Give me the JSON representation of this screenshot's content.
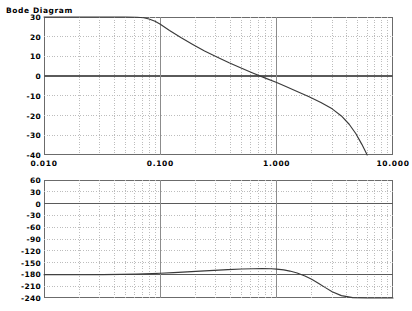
{
  "chart_data": {
    "type": "line",
    "title": "Bode Diagram",
    "subtitle": "",
    "xlabel": "",
    "xscale": "log",
    "xlim": [
      0.01,
      10.0
    ],
    "xticks": [
      0.01,
      0.1,
      1.0,
      10.0
    ],
    "xticklabels": [
      "0.010",
      "0.100",
      "1.000",
      "10.000"
    ],
    "grid": true,
    "grid_minor": true,
    "legend": "none",
    "panels": [
      {
        "name": "magnitude",
        "ylabel": "",
        "ylim": [
          -40,
          30
        ],
        "yticks": [
          30,
          20,
          10,
          0,
          -10,
          -20,
          -30,
          -40
        ],
        "yticklabels": [
          "30",
          "20",
          "10",
          "0",
          "-10",
          "-20",
          "-30",
          "-40"
        ],
        "series": [
          {
            "name": "magnitude-db",
            "x": [
              0.01,
              0.013,
              0.017,
              0.022,
              0.029,
              0.038,
              0.05,
              0.063,
              0.072,
              0.08,
              0.09,
              0.1,
              0.12,
              0.15,
              0.19,
              0.24,
              0.3,
              0.39,
              0.5,
              0.63,
              0.8,
              1.0,
              1.2,
              1.5,
              1.9,
              2.4,
              3.0,
              3.6,
              4.2,
              4.8,
              5.4,
              6.0
            ],
            "y": [
              30.0,
              30.0,
              30.0,
              30.0,
              30.0,
              30.0,
              30.0,
              29.9,
              29.6,
              29.0,
              27.8,
              26.3,
              23.2,
              19.6,
              16.1,
              12.8,
              10.0,
              6.8,
              4.0,
              1.5,
              -1.0,
              -3.2,
              -5.3,
              -7.8,
              -10.5,
              -13.4,
              -16.6,
              -20.2,
              -24.4,
              -29.2,
              -34.6,
              -40.0
            ]
          }
        ]
      },
      {
        "name": "phase",
        "ylabel": "",
        "ylim": [
          -240,
          60
        ],
        "yticks": [
          60,
          30,
          0,
          -30,
          -60,
          -90,
          -120,
          -150,
          -180,
          -210,
          -240
        ],
        "yticklabels": [
          "60",
          "30",
          "0",
          "-30",
          "-60",
          "-90",
          "-120",
          "-150",
          "-180",
          "-210",
          "-240"
        ],
        "series": [
          {
            "name": "phase-deg",
            "x": [
              0.01,
              0.015,
              0.022,
              0.032,
              0.046,
              0.063,
              0.085,
              0.1,
              0.13,
              0.17,
              0.22,
              0.29,
              0.38,
              0.5,
              0.63,
              0.75,
              0.9,
              1.0,
              1.15,
              1.3,
              1.5,
              1.75,
              2.0,
              2.3,
              2.6,
              3.0,
              3.6,
              4.5,
              6.0,
              8.0,
              10.0
            ],
            "y": [
              -181.0,
              -181.0,
              -180.8,
              -180.5,
              -180.0,
              -179.2,
              -178.0,
              -177.2,
              -175.5,
              -173.6,
              -171.6,
              -169.7,
              -167.9,
              -166.4,
              -165.5,
              -165.2,
              -165.6,
              -166.5,
              -168.6,
              -171.5,
              -176.5,
              -184.0,
              -192.5,
              -203.0,
              -213.0,
              -224.0,
              -234.0,
              -239.0,
              -240.0,
              -240.0,
              -240.0
            ]
          }
        ]
      }
    ]
  },
  "colors": {
    "curve": "#3a3a3a",
    "frame": "#6b6b6b",
    "grid_major": "#8c8c8c",
    "grid_minor": "#bdbdbd",
    "axis_emphasis": "#5a5a5a",
    "text": "#000000",
    "background": "#ffffff"
  }
}
